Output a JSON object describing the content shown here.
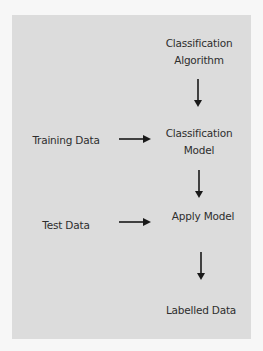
{
  "diagram": {
    "type": "flowchart",
    "nodes": {
      "classification_algorithm": {
        "line1": "Classification",
        "line2": "Algorithm"
      },
      "training_data": "Training Data",
      "classification_model": {
        "line1": "Classification",
        "line2": "Model"
      },
      "test_data": "Test Data",
      "apply_model": "Apply Model",
      "labelled_data": "Labelled Data"
    },
    "edges": [
      {
        "from": "Classification Algorithm",
        "to": "Classification Model"
      },
      {
        "from": "Training Data",
        "to": "Classification Model"
      },
      {
        "from": "Classification Model",
        "to": "Apply Model"
      },
      {
        "from": "Test Data",
        "to": "Apply Model"
      },
      {
        "from": "Apply Model",
        "to": "Labelled Data"
      }
    ],
    "colors": {
      "panel": "#dcdcdc",
      "background": "#f7f7f7",
      "text": "#2e2e2e",
      "arrow": "#1a1a1a"
    }
  }
}
